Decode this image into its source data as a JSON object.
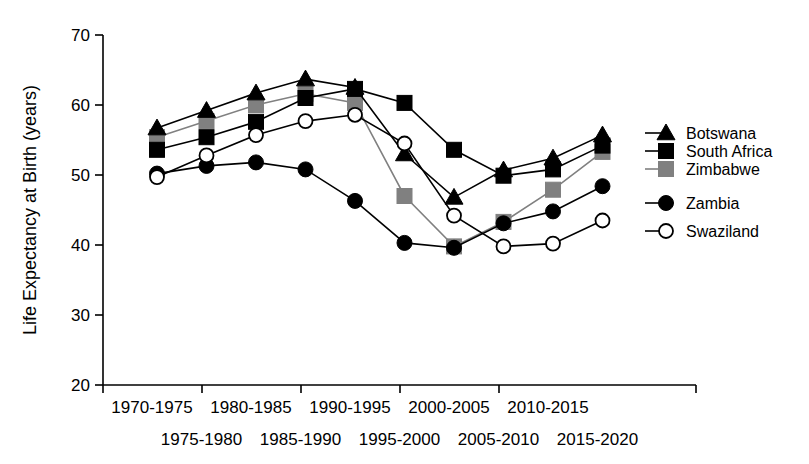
{
  "chart_data": {
    "type": "line",
    "title": "",
    "xlabel": "",
    "ylabel": "Life Expectancy at Birth (years)",
    "ylim": [
      20,
      70
    ],
    "yticks": [
      20,
      30,
      40,
      50,
      60,
      70
    ],
    "grid": false,
    "legend_position": "right",
    "categories": [
      "1970-1975",
      "1975-1980",
      "1980-1985",
      "1985-1990",
      "1990-1995",
      "1995-2000",
      "2000-2005",
      "2005-2010",
      "2010-2015",
      "2015-2020"
    ],
    "series": [
      {
        "name": "Botswana",
        "marker": "filled-triangle",
        "color": "#000000",
        "values": [
          56.7,
          59.2,
          61.7,
          63.7,
          62.5,
          53.0,
          46.8,
          50.7,
          52.4,
          55.7
        ]
      },
      {
        "name": "South Africa",
        "marker": "filled-square",
        "color": "#000000",
        "values": [
          53.6,
          55.4,
          57.6,
          61.0,
          62.3,
          60.3,
          53.6,
          49.9,
          50.8,
          54.2
        ]
      },
      {
        "name": "Zimbabwe",
        "marker": "gray-square",
        "color": "#808080",
        "values": [
          55.4,
          57.7,
          60.0,
          61.6,
          60.3,
          47.0,
          39.8,
          43.3,
          47.9,
          53.3
        ]
      },
      {
        "name": "Zambia",
        "marker": "filled-circle",
        "color": "#000000",
        "values": [
          50.2,
          51.3,
          51.8,
          50.8,
          46.3,
          40.3,
          39.6,
          43.1,
          44.8,
          48.4
        ]
      },
      {
        "name": "Swaziland",
        "marker": "open-circle",
        "color": "#000000",
        "values": [
          49.7,
          52.8,
          55.7,
          57.7,
          58.6,
          54.5,
          44.2,
          39.8,
          40.2,
          43.5
        ]
      }
    ]
  },
  "legend": {
    "items": [
      {
        "label": "Botswana"
      },
      {
        "label": "South Africa"
      },
      {
        "label": "Zimbabwe"
      },
      {
        "label": "Zambia"
      },
      {
        "label": "Swaziland"
      }
    ]
  },
  "axis": {
    "y_title": "Life Expectancy at Birth (years)",
    "y_tick_labels": [
      "70",
      "60",
      "50",
      "40",
      "30",
      "20"
    ],
    "x_tick_labels_row_top": [
      "1970-1975",
      "1980-1985",
      "1990-1995",
      "2000-2005",
      "2010-2015"
    ],
    "x_tick_labels_row_bottom": [
      "1975-1980",
      "1985-1990",
      "1995-2000",
      "2005-2010",
      "2015-2020"
    ]
  }
}
